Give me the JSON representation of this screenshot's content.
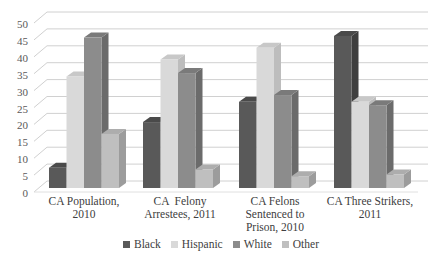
{
  "chart_data": {
    "type": "bar",
    "style": "3d-clustered-column",
    "title": "",
    "xlabel": "",
    "ylabel": "",
    "ylim": [
      0,
      50
    ],
    "yticks": [
      0,
      5,
      10,
      15,
      20,
      25,
      30,
      35,
      40,
      45,
      50
    ],
    "grid": true,
    "legend_position": "bottom",
    "categories": [
      "CA Population, 2010",
      "CA  Felony Arrestees, 2011",
      "CA Felons Sentenced to Prison, 2010",
      "CA Three Strikers, 2011"
    ],
    "category_lines": [
      [
        "CA Population,",
        "2010"
      ],
      [
        "CA  Felony",
        "Arrestees, 2011"
      ],
      [
        "CA Felons",
        "Sentenced to",
        "Prison, 2010"
      ],
      [
        "CA Three Strikers,",
        "2011"
      ]
    ],
    "series": [
      {
        "name": "Black",
        "color": "#595959",
        "side": "#3f3f3f",
        "top": "#4a4a4a",
        "values": [
          6,
          19.5,
          25.5,
          45
        ]
      },
      {
        "name": "Hispanic",
        "color": "#d9d9d9",
        "side": "#bdbdbd",
        "top": "#c8c8c8",
        "values": [
          33,
          38,
          41.5,
          25.5
        ]
      },
      {
        "name": "White",
        "color": "#8c8c8c",
        "side": "#6b6b6b",
        "top": "#7a7a7a",
        "values": [
          44.5,
          34,
          27.5,
          24.5
        ]
      },
      {
        "name": "Other",
        "color": "#bfbfbf",
        "side": "#9c9c9c",
        "top": "#adadad",
        "values": [
          16,
          5.5,
          3.5,
          4
        ]
      }
    ]
  },
  "legend": {
    "items": [
      "Black",
      "Hispanic",
      "White",
      "Other"
    ]
  }
}
